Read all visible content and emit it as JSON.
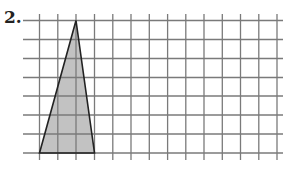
{
  "problem": {
    "number_label": "2."
  },
  "grid": {
    "x_lines": [
      39.5,
      57.8,
      76,
      94.5,
      112.8,
      131,
      149.3,
      167.6,
      185.8,
      204,
      222.3,
      240.5,
      258.8,
      277
    ],
    "y_lines": [
      20.5,
      39.5,
      58.5,
      77.5,
      96,
      115,
      134,
      153
    ],
    "h_extent": [
      23,
      283
    ],
    "v_extent": [
      14,
      160
    ],
    "line_color": "#7a7a7a"
  },
  "triangle": {
    "points": "39.5,153 76,20.5 94.5,153",
    "fill": "#c2c2c2",
    "stroke": "#222222",
    "grid_vertices": [
      [
        0,
        0
      ],
      [
        2,
        7
      ],
      [
        3,
        0
      ]
    ],
    "base_units": 3,
    "height_units": 7
  }
}
